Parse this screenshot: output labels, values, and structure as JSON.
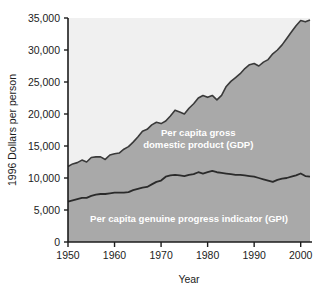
{
  "chart_data": {
    "type": "area",
    "title": "",
    "xlabel": "Year",
    "ylabel": "1996 Dollars per person",
    "xlim": [
      1950,
      2002
    ],
    "ylim": [
      0,
      35000
    ],
    "grid": false,
    "legend_position": "inline-annotations",
    "xticks": [
      "1950",
      "1960",
      "1970",
      "1980",
      "1990",
      "2000"
    ],
    "xtick_values": [
      1950,
      1960,
      1970,
      1980,
      1990,
      2000
    ],
    "yticks": [
      "0",
      "5,000",
      "10,000",
      "15,000",
      "20,000",
      "25,000",
      "30,000",
      "35,000"
    ],
    "ytick_values": [
      0,
      5000,
      10000,
      15000,
      20000,
      25000,
      30000,
      35000
    ],
    "x": [
      1950,
      1951,
      1952,
      1953,
      1954,
      1955,
      1956,
      1957,
      1958,
      1959,
      1960,
      1961,
      1962,
      1963,
      1964,
      1965,
      1966,
      1967,
      1968,
      1969,
      1970,
      1971,
      1972,
      1973,
      1974,
      1975,
      1976,
      1977,
      1978,
      1979,
      1980,
      1981,
      1982,
      1983,
      1984,
      1985,
      1986,
      1987,
      1988,
      1989,
      1990,
      1991,
      1992,
      1993,
      1994,
      1995,
      1996,
      1997,
      1998,
      1999,
      2000,
      2001,
      2002
    ],
    "series": [
      {
        "name": "Per capita gross domestic product (GDP)",
        "label": "Per capita gross\ndomestic product (GDP)",
        "color": "#a9a9a9",
        "line_color": "#3a3a3a",
        "values": [
          11800,
          12200,
          12400,
          12800,
          12500,
          13200,
          13300,
          13300,
          12900,
          13600,
          13800,
          13900,
          14500,
          14900,
          15600,
          16400,
          17300,
          17600,
          18300,
          18700,
          18500,
          18900,
          19700,
          20600,
          20300,
          20000,
          20900,
          21600,
          22500,
          22900,
          22600,
          22900,
          22200,
          22900,
          24300,
          25100,
          25700,
          26300,
          27100,
          27700,
          27900,
          27500,
          28100,
          28500,
          29400,
          30000,
          30800,
          31800,
          32800,
          33800,
          34600,
          34400,
          34700
        ]
      },
      {
        "name": "Per capita genuine progress indicator (GPI)",
        "label": "Per capita genuine progress indicator (GPI)",
        "color": "#a9a9a9",
        "line_color": "#2b2b2b",
        "values": [
          6300,
          6500,
          6700,
          6900,
          6900,
          7200,
          7400,
          7500,
          7500,
          7600,
          7700,
          7700,
          7700,
          7800,
          8100,
          8300,
          8500,
          8600,
          9000,
          9400,
          9600,
          10200,
          10400,
          10500,
          10400,
          10300,
          10500,
          10600,
          10900,
          10700,
          10900,
          11100,
          10900,
          10800,
          10700,
          10600,
          10500,
          10500,
          10400,
          10300,
          10200,
          10000,
          9800,
          9600,
          9400,
          9700,
          9900,
          10000,
          10200,
          10400,
          10700,
          10300,
          10200
        ]
      }
    ],
    "annotations": [
      {
        "name": "gdp-band-label",
        "lines": [
          "Per capita gross",
          "domestic product (GDP)"
        ],
        "x": 1978,
        "y": 16500
      },
      {
        "name": "gpi-band-label",
        "lines": [
          "Per capita genuine progress indicator (GPI)"
        ],
        "x": 1976,
        "y": 3200
      }
    ],
    "colors": {
      "upper_background": "#f0f0f0",
      "gdp_band": "#a9a9a9",
      "gpi_band": "#a9a9a9",
      "axis": "#1c1c1c",
      "label_text": "#ffffff",
      "page_background": "#ffffff"
    }
  }
}
